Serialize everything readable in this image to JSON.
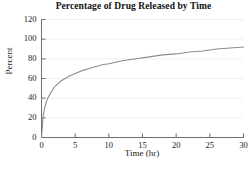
{
  "chart_data": {
    "type": "line",
    "title": "Percentage of Drug Released by Time",
    "xlabel": "Time (hr)",
    "ylabel": "Percent",
    "xlim": [
      0,
      30
    ],
    "ylim": [
      0,
      120
    ],
    "xticks": [
      0,
      5,
      10,
      15,
      20,
      25,
      30
    ],
    "yticks": [
      0,
      20,
      40,
      60,
      80,
      100,
      120
    ],
    "xtick_labels": [
      "0",
      "5",
      "10",
      "15",
      "20",
      "25",
      "30"
    ],
    "ytick_labels": [
      "0",
      "20",
      "40",
      "60",
      "80",
      "100",
      "120"
    ],
    "grid": "horizontal",
    "legend": "none",
    "series": [
      {
        "name": "Drug released",
        "color": "#8c8c8c",
        "x": [
          0,
          0.25,
          0.5,
          0.75,
          1,
          1.5,
          2,
          2.5,
          3,
          4,
          5,
          6,
          7,
          8,
          9,
          10,
          12,
          14,
          16,
          18,
          20,
          22,
          24,
          26,
          28,
          30
        ],
        "y": [
          0,
          22,
          31,
          37,
          41,
          47,
          52,
          55,
          58,
          62,
          65,
          68,
          70,
          72,
          74,
          75,
          78,
          80,
          82,
          84,
          85,
          87,
          88,
          90,
          91,
          92
        ]
      }
    ],
    "annotations": []
  },
  "chart": {
    "title": "Percentage of Drug Released by Time",
    "ylabel": "Percent",
    "xlabel": "Time (hr)"
  },
  "colors": {
    "curve": "#8c8c8c",
    "axis": "#6e6e6e",
    "grid": "#f0f0f0",
    "text": "#1a1a1a",
    "background": "#ffffff"
  }
}
